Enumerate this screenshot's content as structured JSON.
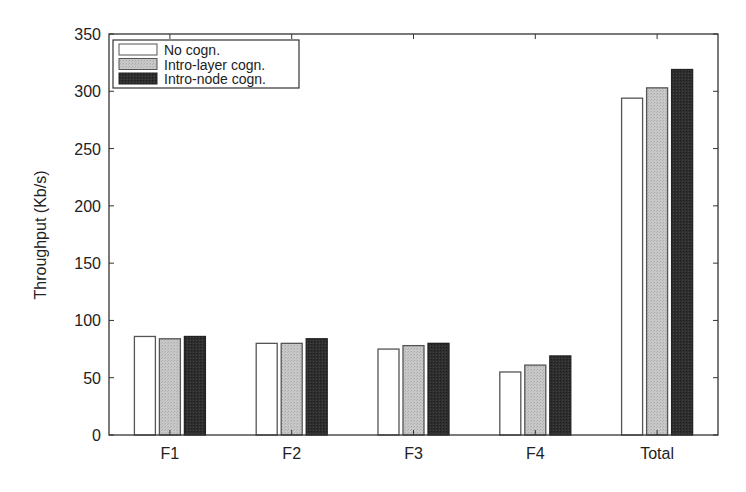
{
  "chart_data": {
    "type": "bar",
    "title": "",
    "xlabel": "",
    "ylabel": "Throughput (Kb/s)",
    "ylim": [
      0,
      350
    ],
    "yticks": [
      0,
      50,
      100,
      150,
      200,
      250,
      300,
      350
    ],
    "grid": false,
    "legend_position": "upper left",
    "categories": [
      "F1",
      "F2",
      "F3",
      "F4",
      "Total"
    ],
    "series": [
      {
        "name": "No cogn.",
        "values": [
          86,
          80,
          75,
          55,
          294
        ],
        "fill": "#ffffff",
        "stroke": "#555555"
      },
      {
        "name": "Intro-layer cogn.",
        "values": [
          84,
          80,
          78,
          61,
          303
        ],
        "fill": "#c4c4c4",
        "stroke": "#555555"
      },
      {
        "name": "Intro-node cogn.",
        "values": [
          86,
          84,
          80,
          69,
          319
        ],
        "fill": "#2b2b2b",
        "stroke": "#222222"
      }
    ]
  }
}
